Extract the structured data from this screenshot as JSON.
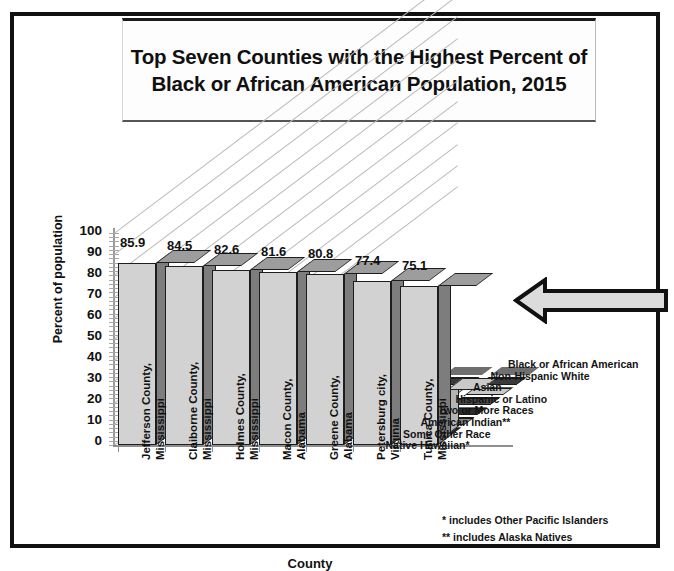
{
  "title": "Top Seven Counties with the Highest Percent of Black or African American Population, 2015",
  "footnotes": {
    "single_star": "*   includes Other Pacific Islanders",
    "double_star": "** includes Alaska Natives"
  },
  "annotation": {
    "arrow": "left-arrow-pointing-at-bars"
  },
  "colors": {
    "bar_front": "#d2d2d2",
    "bar_side": "#7d7d7d",
    "bar_top": "#9d9d9d",
    "white_bar": "#ffffff",
    "outline": "#1d1d1d",
    "frame": "#111111",
    "gridline": "#b9b9b9"
  },
  "chart_data": {
    "type": "bar",
    "title": "Top Seven Counties with the Highest Percent of Black or African American Population, 2015",
    "xlabel": "County",
    "ylabel": "Percent of population",
    "ylim": [
      0,
      100
    ],
    "yticks": [
      100,
      90,
      80,
      70,
      60,
      50,
      40,
      30,
      20,
      10,
      0
    ],
    "grid": true,
    "legend_position": "right-inside",
    "three_d": true,
    "categories": [
      "Jefferson County, Mississippi",
      "Claiborne County, Mississippi",
      "Holmes County, Mississippi",
      "Macon County, Alabama",
      "Greene County, Alabama",
      "Petersburg city, Virginia",
      "Tunica County, Mississippi"
    ],
    "category_lines": [
      [
        "Jefferson County,",
        "Mississippi"
      ],
      [
        "Claiborne County,",
        "Mississippi"
      ],
      [
        "Holmes County,",
        "Mississippi"
      ],
      [
        "Macon County,",
        "Alabama"
      ],
      [
        "Greene County,",
        "Alabama"
      ],
      [
        "Petersburg city,",
        "Virginia"
      ],
      [
        "Tunica County,",
        "Mississippi"
      ]
    ],
    "series": [
      {
        "name": "Black or African American",
        "values": [
          85.9,
          84.5,
          82.6,
          81.6,
          80.8,
          77.4,
          75.1
        ],
        "labeled": true
      },
      {
        "name": "Non-Hispanic White",
        "values": [
          12.0,
          13.0,
          14.0,
          14.0,
          15.0,
          16.0,
          21.0
        ],
        "labeled": false
      },
      {
        "name": "Asian",
        "values": [
          0.2,
          0.2,
          0.2,
          0.5,
          0.2,
          0.8,
          0.3
        ],
        "labeled": false
      },
      {
        "name": "Hispanic or Latino",
        "values": [
          0.6,
          0.7,
          1.0,
          1.8,
          1.2,
          3.0,
          3.5
        ],
        "labeled": false
      },
      {
        "name": "Two or More Races",
        "values": [
          0.5,
          0.6,
          0.6,
          0.8,
          0.7,
          1.6,
          0.9
        ],
        "labeled": false
      },
      {
        "name": "American Indian**",
        "values": [
          0.1,
          0.1,
          0.1,
          0.2,
          0.1,
          0.3,
          0.2
        ],
        "labeled": false
      },
      {
        "name": "Some Other Race",
        "values": [
          0.1,
          0.2,
          0.2,
          0.3,
          0.2,
          0.4,
          0.3
        ],
        "labeled": false
      },
      {
        "name": "Native Hawaiian*",
        "values": [
          0.0,
          0.0,
          0.0,
          0.1,
          0.0,
          0.1,
          0.0
        ],
        "labeled": false
      }
    ],
    "data_labels": [
      "85.9",
      "84.5",
      "82.6",
      "81.6",
      "80.8",
      "77.4",
      "75.1"
    ],
    "legend": [
      "Black or African American",
      "Non-Hispanic White",
      "Asian",
      "Hispanic or Latino",
      "Two or More Races",
      "American Indian**",
      "Some Other Race",
      "Native Hawaiian*"
    ]
  }
}
